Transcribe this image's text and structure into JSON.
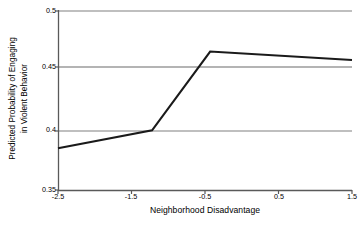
{
  "chart_data": {
    "type": "line",
    "title": "",
    "xlabel": "Neighborhood Disadvantage",
    "ylabel_line1": "Predicted Probability of Engaging",
    "ylabel_line2": "in Violent Behavior",
    "ylabel": "Predicted Probability of Engaging in Violent Behavior",
    "x": [
      -2.5,
      -1.22,
      -0.43,
      1.5
    ],
    "y": [
      0.385,
      0.4,
      0.466,
      0.459
    ],
    "series": [
      {
        "name": "Predicted probability",
        "x": [
          -2.5,
          -1.22,
          -0.43,
          1.5
        ],
        "values": [
          0.385,
          0.4,
          0.466,
          0.459
        ],
        "color": "#1a1a1a"
      }
    ],
    "xlim": [
      -2.5,
      1.5
    ],
    "ylim": [
      0.35,
      0.5
    ],
    "xticks": [
      -2.5,
      -1.5,
      -0.5,
      0.5,
      1.5
    ],
    "xtick_labels": [
      "-2.5",
      "-1.5",
      "-0.5",
      "0.5",
      "1.5"
    ],
    "yticks": [
      0.35,
      0.4,
      0.45,
      0.5
    ],
    "ytick_labels": [
      "0.35",
      "0.4",
      "0.45",
      "0.5"
    ],
    "grid": true,
    "grid_axis": "y",
    "grid_color": "#808080",
    "axis_color": "#595959",
    "legend": "none",
    "legend_position": "none",
    "background": "#ffffff"
  }
}
